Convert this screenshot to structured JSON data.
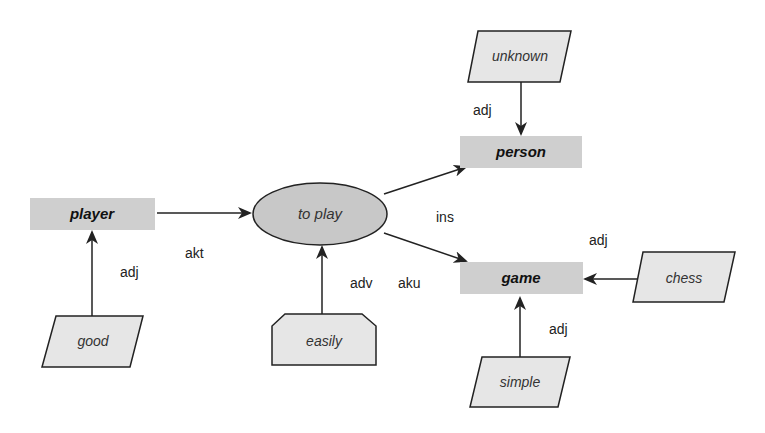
{
  "diagram": {
    "concepts": {
      "player": "player",
      "person": "person",
      "game": "game"
    },
    "action": "to play",
    "attributes": {
      "good": "good",
      "easily": "easily",
      "unknown": "unknown",
      "chess": "chess",
      "simple": "simple"
    },
    "relations": {
      "akt": "akt",
      "ins": "ins",
      "aku": "aku",
      "adv": "adv",
      "adj_player": "adj",
      "adj_person": "adj",
      "adj_game_chess": "adj",
      "adj_game_simple": "adj"
    },
    "colors": {
      "concept_fill": "#cfcfcf",
      "attribute_fill": "#e6e6e6",
      "ellipse_fill": "#c8c8c8",
      "stroke": "#222222"
    }
  }
}
